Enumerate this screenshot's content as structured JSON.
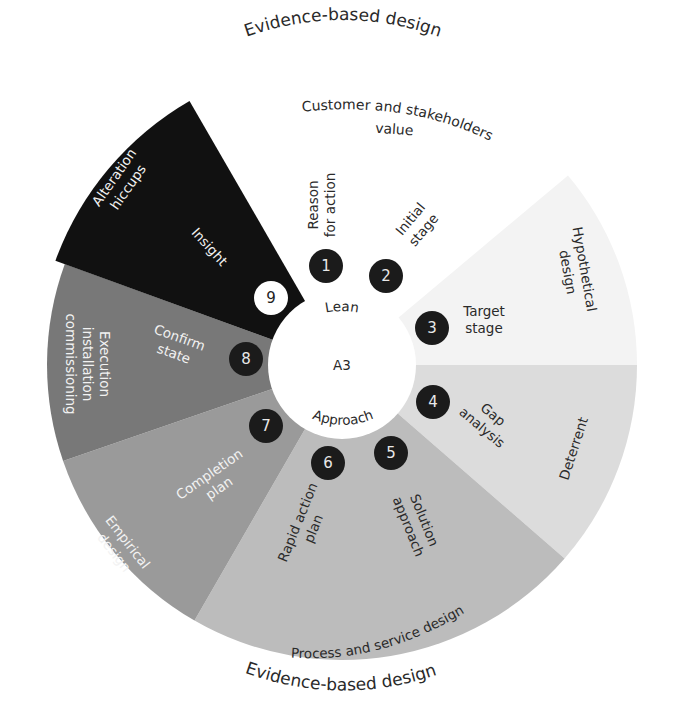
{
  "diagram": {
    "title_top": "Evidence-based design",
    "title_bottom": "Evidence-based design",
    "center": {
      "label": "A3",
      "top_label": "Lean",
      "bottom_label": "Approach"
    },
    "outer_top_label_line1": "Customer and stakeholders",
    "outer_top_label_line2": "value",
    "sectors": [
      {
        "id": "hypothetical",
        "label_line1": "Hypothetical",
        "label_line2": "design",
        "color": "#f3f3f3"
      },
      {
        "id": "deterrent",
        "label_line1": "Deterrent",
        "label_line2": "",
        "color": "#dcdcdc"
      },
      {
        "id": "process",
        "label_line1": "Process and service design",
        "label_line2": "",
        "color": "#bcbcbc"
      },
      {
        "id": "empirical",
        "label_line1": "Empirical",
        "label_line2": "design",
        "color": "#9a9a9a"
      },
      {
        "id": "execution",
        "label_line1": "Execution",
        "label_line2": "installation",
        "label_line3": "commissioning",
        "color": "#787878"
      },
      {
        "id": "alteration",
        "label_line1": "Alteration",
        "label_line2": "hiccups",
        "color": "#111111"
      }
    ],
    "steps": [
      {
        "number": "1",
        "label_line1": "Reason",
        "label_line2": "for action"
      },
      {
        "number": "2",
        "label_line1": "Initial",
        "label_line2": "stage"
      },
      {
        "number": "3",
        "label_line1": "Target",
        "label_line2": "stage"
      },
      {
        "number": "4",
        "label_line1": "Gap",
        "label_line2": "analysis"
      },
      {
        "number": "5",
        "label_line1": "Solution",
        "label_line2": "approach"
      },
      {
        "number": "6",
        "label_line1": "Rapid action",
        "label_line2": "plan"
      },
      {
        "number": "7",
        "label_line1": "Completion",
        "label_line2": "plan"
      },
      {
        "number": "8",
        "label_line1": "Confirm",
        "label_line2": "state"
      },
      {
        "number": "9",
        "label_line1": "Insight",
        "label_line2": ""
      }
    ]
  }
}
